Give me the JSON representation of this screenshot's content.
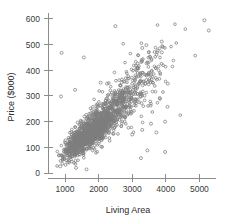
{
  "chart_data": {
    "type": "scatter",
    "title": "",
    "xlabel": "Living Area",
    "ylabel": "Price ($000)",
    "xlim": [
      600,
      5500
    ],
    "ylim": [
      0,
      620
    ],
    "xticks": [
      1000,
      2000,
      3000,
      4000,
      5000
    ],
    "xtick_labels": [
      "1000",
      "2000",
      "3000",
      "4000",
      "5000"
    ],
    "yticks": [
      0,
      100,
      200,
      300,
      400,
      500,
      600
    ],
    "ytick_labels": [
      "0",
      "100",
      "200",
      "300",
      "400",
      "500",
      "600"
    ],
    "grid": false,
    "legend": null,
    "marker": "open-circle",
    "marker_color": "#7d7d7d",
    "n_points": 1728,
    "clusters": [
      {
        "n": 1050,
        "x_mean": 1650,
        "x_sd": 330,
        "y_intercept": -15,
        "y_slope": 0.098,
        "y_sd": 26
      },
      {
        "n": 430,
        "x_mean": 2350,
        "x_sd": 430,
        "y_intercept": -10,
        "y_slope": 0.104,
        "y_sd": 40
      },
      {
        "n": 170,
        "x_mean": 3050,
        "x_sd": 460,
        "y_intercept": 5,
        "y_slope": 0.105,
        "y_sd": 62
      },
      {
        "n": 60,
        "x_mean": 3550,
        "x_sd": 520,
        "y_intercept": 20,
        "y_slope": 0.1,
        "y_sd": 85
      }
    ],
    "named_outliers": [
      {
        "x": 5150,
        "y": 595
      },
      {
        "x": 5280,
        "y": 555
      },
      {
        "x": 2500,
        "y": 572
      },
      {
        "x": 3880,
        "y": 512
      },
      {
        "x": 3420,
        "y": 498
      },
      {
        "x": 3300,
        "y": 487
      },
      {
        "x": 3880,
        "y": 470
      },
      {
        "x": 3760,
        "y": 477
      },
      {
        "x": 900,
        "y": 468
      },
      {
        "x": 1560,
        "y": 450
      },
      {
        "x": 3280,
        "y": 440
      },
      {
        "x": 3430,
        "y": 427
      },
      {
        "x": 3160,
        "y": 408
      },
      {
        "x": 3550,
        "y": 382
      },
      {
        "x": 3700,
        "y": 370
      },
      {
        "x": 3420,
        "y": 362
      },
      {
        "x": 4060,
        "y": 348
      },
      {
        "x": 2060,
        "y": 352
      },
      {
        "x": 2250,
        "y": 348
      },
      {
        "x": 1300,
        "y": 324
      },
      {
        "x": 880,
        "y": 298
      },
      {
        "x": 3820,
        "y": 292
      },
      {
        "x": 4050,
        "y": 258
      },
      {
        "x": 2980,
        "y": 236
      },
      {
        "x": 3980,
        "y": 200
      },
      {
        "x": 3560,
        "y": 192
      },
      {
        "x": 3300,
        "y": 168
      },
      {
        "x": 3720,
        "y": 158
      },
      {
        "x": 3000,
        "y": 150
      },
      {
        "x": 3450,
        "y": 88
      },
      {
        "x": 3980,
        "y": 82
      },
      {
        "x": 3260,
        "y": 58
      },
      {
        "x": 1330,
        "y": 20
      },
      {
        "x": 1640,
        "y": 14
      },
      {
        "x": 860,
        "y": 26
      }
    ]
  },
  "axes": {
    "x_title": "Living Area",
    "y_title": "Price ($000)"
  }
}
